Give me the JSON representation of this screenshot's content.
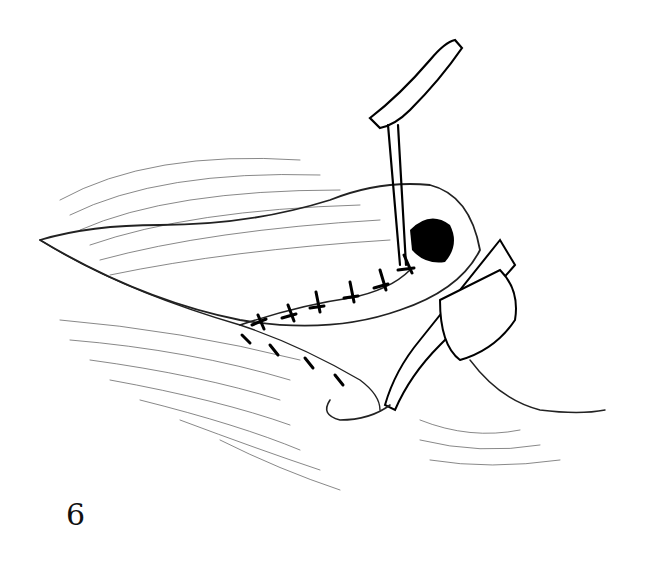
{
  "figure": {
    "label": "6",
    "colors": {
      "ink": "#111111",
      "background": "#ffffff"
    }
  }
}
